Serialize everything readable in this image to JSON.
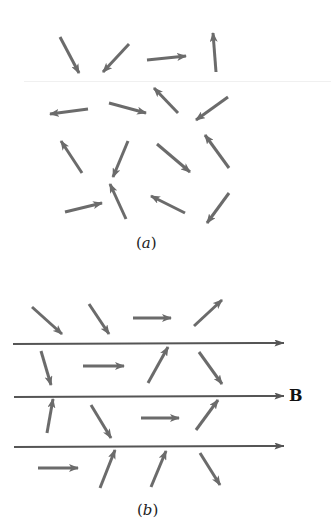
{
  "figure": {
    "panels": [
      {
        "id": "a",
        "label": "a",
        "description": "Randomly oriented magnetic dipoles, no external field",
        "arrows": [
          {
            "x1": 60,
            "y1": 37,
            "x2": 79,
            "y2": 73
          },
          {
            "x1": 129,
            "y1": 44,
            "x2": 103,
            "y2": 72
          },
          {
            "x1": 147,
            "y1": 60,
            "x2": 186,
            "y2": 56
          },
          {
            "x1": 216,
            "y1": 72,
            "x2": 213,
            "y2": 33
          },
          {
            "x1": 88,
            "y1": 109,
            "x2": 50,
            "y2": 114
          },
          {
            "x1": 109,
            "y1": 103,
            "x2": 146,
            "y2": 113
          },
          {
            "x1": 178,
            "y1": 113,
            "x2": 154,
            "y2": 88
          },
          {
            "x1": 228,
            "y1": 97,
            "x2": 196,
            "y2": 120
          },
          {
            "x1": 82,
            "y1": 173,
            "x2": 61,
            "y2": 141
          },
          {
            "x1": 128,
            "y1": 141,
            "x2": 113,
            "y2": 177
          },
          {
            "x1": 157,
            "y1": 144,
            "x2": 190,
            "y2": 172
          },
          {
            "x1": 229,
            "y1": 168,
            "x2": 205,
            "y2": 135
          },
          {
            "x1": 65,
            "y1": 212,
            "x2": 102,
            "y2": 203
          },
          {
            "x1": 126,
            "y1": 219,
            "x2": 110,
            "y2": 184
          },
          {
            "x1": 185,
            "y1": 213,
            "x2": 151,
            "y2": 196
          },
          {
            "x1": 229,
            "y1": 193,
            "x2": 207,
            "y2": 223
          }
        ]
      },
      {
        "id": "b",
        "label": "b",
        "description": "Dipoles partially aligned with applied magnetic field B",
        "field_label": "B",
        "field_lines": [
          {
            "x1": 13,
            "y1": 344,
            "x2": 284,
            "y2": 343
          },
          {
            "x1": 14,
            "y1": 397,
            "x2": 284,
            "y2": 396
          },
          {
            "x1": 14,
            "y1": 447,
            "x2": 284,
            "y2": 446
          }
        ],
        "arrows": [
          {
            "x1": 32,
            "y1": 307,
            "x2": 62,
            "y2": 334
          },
          {
            "x1": 89,
            "y1": 304,
            "x2": 109,
            "y2": 334
          },
          {
            "x1": 133,
            "y1": 318,
            "x2": 171,
            "y2": 318
          },
          {
            "x1": 194,
            "y1": 326,
            "x2": 222,
            "y2": 300
          },
          {
            "x1": 41,
            "y1": 351,
            "x2": 51,
            "y2": 385
          },
          {
            "x1": 83,
            "y1": 366,
            "x2": 124,
            "y2": 366
          },
          {
            "x1": 148,
            "y1": 383,
            "x2": 168,
            "y2": 347
          },
          {
            "x1": 199,
            "y1": 352,
            "x2": 222,
            "y2": 384
          },
          {
            "x1": 47,
            "y1": 433,
            "x2": 53,
            "y2": 399
          },
          {
            "x1": 91,
            "y1": 405,
            "x2": 111,
            "y2": 438
          },
          {
            "x1": 141,
            "y1": 418,
            "x2": 179,
            "y2": 418
          },
          {
            "x1": 196,
            "y1": 430,
            "x2": 218,
            "y2": 400
          },
          {
            "x1": 38,
            "y1": 468,
            "x2": 78,
            "y2": 468
          },
          {
            "x1": 100,
            "y1": 488,
            "x2": 115,
            "y2": 450
          },
          {
            "x1": 151,
            "y1": 487,
            "x2": 166,
            "y2": 451
          },
          {
            "x1": 200,
            "y1": 453,
            "x2": 220,
            "y2": 485
          }
        ]
      }
    ],
    "colors": {
      "dipole_arrow": "#6b6b6b",
      "field_line": "#555555",
      "background": "#ffffff"
    }
  }
}
